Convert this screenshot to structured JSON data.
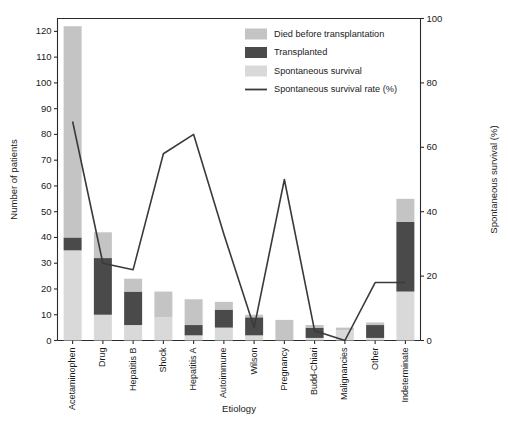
{
  "chart_data": {
    "type": "bar",
    "subtype": "stacked-bar-with-line-overlay",
    "title": "",
    "xlabel": "Etiology",
    "ylabel": "Number of patients",
    "y2label": "Spontaneous survival (%)",
    "ylim": [
      0,
      125
    ],
    "y2lim": [
      0,
      100
    ],
    "yticks": [
      0,
      10,
      20,
      30,
      40,
      50,
      60,
      70,
      80,
      90,
      100,
      110,
      120
    ],
    "y2ticks": [
      0,
      20,
      40,
      60,
      80,
      100
    ],
    "grid": false,
    "legend_position": "top-right",
    "categories": [
      "Acetaminophen",
      "Drug",
      "Hepatitis B",
      "Shock",
      "Hepatitis A",
      "Autoimmune",
      "Wilson",
      "Pregnancy",
      "Budd-Chiari",
      "Malignancies",
      "Other",
      "Indeterminate"
    ],
    "series": [
      {
        "name": "Spontaneous survival",
        "color": "#d9d9d9",
        "stack_order": 1,
        "values": [
          35,
          10,
          6,
          9,
          2,
          5,
          2,
          0,
          1,
          4,
          1,
          19
        ]
      },
      {
        "name": "Transplanted",
        "color": "#4a4a4a",
        "stack_order": 2,
        "values": [
          5,
          22,
          13,
          0,
          4,
          7,
          7,
          0,
          4,
          0,
          5,
          27
        ]
      },
      {
        "name": "Died before transplantation",
        "color": "#c4c4c4",
        "stack_order": 3,
        "values": [
          82,
          10,
          5,
          10,
          10,
          3,
          1,
          8,
          1,
          1,
          1,
          9
        ]
      }
    ],
    "totals": [
      122,
      42,
      24,
      19,
      16,
      15,
      10,
      8,
      6,
      5,
      7,
      55
    ],
    "line_series": {
      "name": "Spontaneous survival rate (%)",
      "color": "#3a3a3a",
      "axis": "right",
      "values": [
        68,
        24,
        22,
        58,
        64,
        33,
        4,
        50,
        3,
        0,
        18,
        18
      ]
    },
    "legend": [
      {
        "label": "Died before transplantation",
        "marker": "swatch",
        "color": "#c4c4c4"
      },
      {
        "label": "Transplanted",
        "marker": "swatch",
        "color": "#4a4a4a"
      },
      {
        "label": "Spontaneous survival",
        "marker": "swatch",
        "color": "#d9d9d9"
      },
      {
        "label": "Spontaneous survival rate (%)",
        "marker": "line",
        "color": "#3a3a3a"
      }
    ]
  },
  "caption": {
    "text": ""
  }
}
